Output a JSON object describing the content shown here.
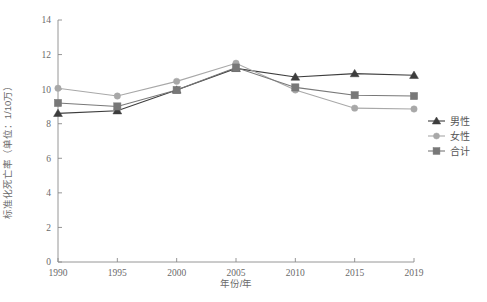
{
  "chart_data": {
    "type": "line",
    "title": "",
    "xlabel": "年份/年",
    "ylabel": "标准化死亡率（单位：1/10万）",
    "categories": [
      "1990",
      "1995",
      "2000",
      "2005",
      "2010",
      "2015",
      "2019"
    ],
    "x": [
      1990,
      1995,
      2000,
      2005,
      2010,
      2015,
      2019
    ],
    "xlim": [
      1990,
      2019
    ],
    "ylim": [
      0,
      14
    ],
    "yticks": [
      "0",
      "2",
      "4",
      "6",
      "8",
      "10",
      "12",
      "14"
    ],
    "ytick_values": [
      0,
      2,
      4,
      6,
      8,
      10,
      12,
      14
    ],
    "grid": false,
    "legend_position": "right",
    "series": [
      {
        "name": "男性",
        "marker": "triangle",
        "color": "#3d3d3d",
        "values": [
          8.6,
          8.75,
          9.95,
          11.2,
          10.7,
          10.9,
          10.8
        ]
      },
      {
        "name": "女性",
        "marker": "circle",
        "color": "#a8a8a8",
        "values": [
          10.05,
          9.6,
          10.45,
          11.5,
          9.95,
          8.9,
          8.85
        ]
      },
      {
        "name": "合计",
        "marker": "square",
        "color": "#787878",
        "values": [
          9.2,
          9.0,
          9.95,
          11.25,
          10.1,
          9.65,
          9.6
        ]
      }
    ]
  },
  "legend": {
    "items": [
      {
        "label": "男性"
      },
      {
        "label": "女性"
      },
      {
        "label": "合计"
      }
    ]
  },
  "axes": {
    "x_title": "年份/年",
    "y_title": "标准化死亡率（单位：1/10万）"
  },
  "colors": {
    "male": "#3d3d3d",
    "female": "#a8a8a8",
    "total": "#787878",
    "axis": "#8a8a8a",
    "text": "#6a6a6a",
    "background": "#ffffff"
  }
}
